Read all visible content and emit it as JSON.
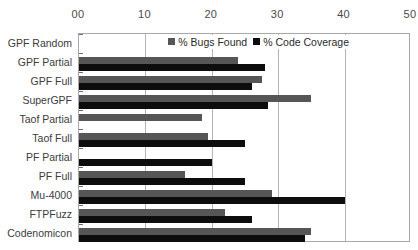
{
  "chart_data": {
    "type": "bar",
    "orientation": "horizontal",
    "title": "",
    "xlabel": "",
    "ylabel": "",
    "xlim": [
      0,
      50
    ],
    "xticks": [
      "00",
      "10",
      "20",
      "30",
      "40",
      "50"
    ],
    "xtick_values": [
      0,
      10,
      20,
      30,
      40,
      50
    ],
    "grid": true,
    "legend_position": "top-center-inside",
    "categories": [
      "GPF Random",
      "GPF Partial",
      "GPF Full",
      "SuperGPF",
      "Taof Partial",
      "Taof Full",
      "PF Partial",
      "PF Full",
      "Mu-4000",
      "FTPFuzz",
      "Codenomicon"
    ],
    "series": [
      {
        "name": "% Bugs Found",
        "color": "#565656",
        "values": [
          0,
          24,
          27.5,
          35,
          18.5,
          19.5,
          0,
          16,
          29,
          22,
          35
        ]
      },
      {
        "name": "% Code Coverage",
        "color": "#0d0d0d",
        "values": [
          0,
          28,
          26,
          28.5,
          0,
          25,
          20,
          25,
          40,
          26,
          34
        ]
      }
    ]
  },
  "colors": {
    "bugs_found": "#565656",
    "code_coverage": "#0d0d0d",
    "plot_border": "#a9a9a9",
    "gridline": "#b4b4b4",
    "background": "#ffffff"
  }
}
